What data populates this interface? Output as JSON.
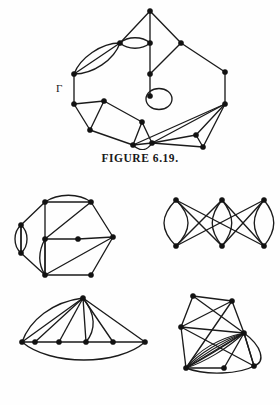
{
  "page": {
    "background_color": "#fefefe",
    "ink_color": "#1b1b1b"
  },
  "figures": [
    {
      "id": "figure-6-19",
      "caption": "FIGURE 6.19.",
      "label": "Γ",
      "label_description": "Greek capital Gamma labelling the graph",
      "description": "A large multigraph drawn as an irregular ring of vertices, containing a triple edge on the upper left, a double edge near the top, a pendant self-loop in the centre, and two triangulated clusters at the lower left and lower right.",
      "vertex_count": 15,
      "has_self_loop": true,
      "has_multiple_edges": true
    },
    {
      "id": "figure-6-20",
      "caption": "FIGURE 6.20.",
      "description": "Four smaller multigraphs arranged in a two by two block.",
      "subfigures": [
        {
          "id": "subfigure-top-left",
          "description": "Hexagonal multigraph with a double edge across the top, a triple edge on the left side, a double edge in the interior and several chords.",
          "vertex_count": 8
        },
        {
          "id": "subfigure-top-right",
          "description": "Three vertical lens shaped double edge pairs joined by crossing diagonal edges.",
          "vertex_count": 6
        },
        {
          "id": "subfigure-bottom-left",
          "description": "Fan multigraph: an apex vertex joined to six vertices on a horizontal path, with a double edge to one of them and a long curved edge closing the outer boundary.",
          "vertex_count": 7
        },
        {
          "id": "subfigure-bottom-right",
          "description": "Dense multigraph with many parallel curved edges between a right hand vertex and a lower left vertex, plus crossing straight edges.",
          "vertex_count": 6
        }
      ]
    }
  ]
}
